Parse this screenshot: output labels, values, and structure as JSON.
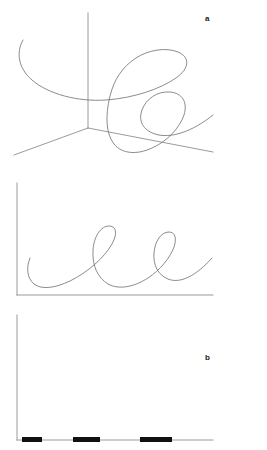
{
  "figure": {
    "width": 267,
    "height": 450,
    "background_color": "#ffffff",
    "stroke_color": "#76767c",
    "axis_color": "#8f8f94",
    "bar_color": "#111111"
  },
  "panels": [
    {
      "id": "a",
      "label": "a",
      "label_position": {
        "x": 205,
        "y": 15
      },
      "type": "trajectory-3d",
      "description": "Three-dimensional chaotic trajectory drawn over a three-axis coordinate frame",
      "axes": {
        "style": "3d-corner",
        "origin": {
          "x": 88,
          "y": 128
        },
        "z_axis_top": {
          "x": 88,
          "y": 13
        },
        "x_axis_end": {
          "x": 213,
          "y": 152
        },
        "y_axis_end": {
          "x": 14,
          "y": 155
        }
      }
    },
    {
      "id": "b",
      "label": "b",
      "label_position": {
        "x": 205,
        "y": 184
      },
      "type": "trajectory-2d",
      "description": "Two-dimensional oscillating trajectory with two tall narrow loops",
      "axes": {
        "style": "2d-L",
        "origin": {
          "x": 17,
          "y": 295
        },
        "y_axis_top": {
          "x": 17,
          "y": 183
        },
        "x_axis_end": {
          "x": 213,
          "y": 295
        }
      }
    },
    {
      "id": "c",
      "label": "c",
      "label_position": {
        "x": 205,
        "y": 318
      },
      "type": "bar-segments",
      "description": "Two-dimensional axes with three thick black horizontal bar segments lying on the baseline",
      "axes": {
        "style": "2d-L",
        "origin": {
          "x": 17,
          "y": 440
        },
        "y_axis_top": {
          "x": 17,
          "y": 315
        },
        "x_axis_end": {
          "x": 213,
          "y": 440
        }
      }
    }
  ],
  "chart_data": [
    {
      "type": "line",
      "panel": "a",
      "title": "",
      "xlabel": "",
      "ylabel": "",
      "grid": false,
      "legend": null,
      "projection": "3d",
      "series": [
        {
          "name": "trajectory-a",
          "path": "M 23,40 C 16,52 18,68 32,80 C 48,94 78,102 106,100 C 134,98 160,89 176,78 C 190,68 190,57 178,52 C 166,47 148,50 136,58 C 122,67 114,80 110,96 C 105,116 106,134 114,144 C 122,154 137,155 152,148 C 168,141 180,127 184,115 C 188,102 182,93 170,92 C 157,91 146,99 142,110 C 138,121 143,130 155,134 C 170,139 192,132 213,115"
        }
      ]
    },
    {
      "type": "line",
      "panel": "b",
      "title": "",
      "xlabel": "",
      "ylabel": "",
      "grid": false,
      "legend": null,
      "projection": "2d",
      "series": [
        {
          "name": "trajectory-b",
          "path": "M 30,258 C 26,268 27,278 34,284 C 42,290 55,288 70,281 C 88,272 104,258 112,244 C 118,233 116,226 109,226 C 101,226 94,236 93,250 C 92,266 98,278 108,284 C 119,290 134,287 148,278 C 160,270 170,258 174,247 C 177,238 175,232 169,232 C 161,232 155,241 154,253 C 153,265 158,275 168,279 C 180,284 196,276 212,258"
        }
      ]
    },
    {
      "type": "bar",
      "panel": "c",
      "title": "",
      "xlabel": "",
      "ylabel": "",
      "grid": false,
      "legend": null,
      "orientation": "horizontal-segments",
      "categories": [
        "segment-1",
        "segment-2",
        "segment-3"
      ],
      "values": [
        20,
        27,
        32
      ],
      "bars": [
        {
          "x_start": 22,
          "x_end": 42,
          "width": 20,
          "y": 437,
          "height": 5
        },
        {
          "x_start": 73,
          "x_end": 100,
          "width": 27,
          "y": 437,
          "height": 5
        },
        {
          "x_start": 140,
          "x_end": 172,
          "width": 32,
          "y": 437,
          "height": 5
        }
      ]
    }
  ]
}
